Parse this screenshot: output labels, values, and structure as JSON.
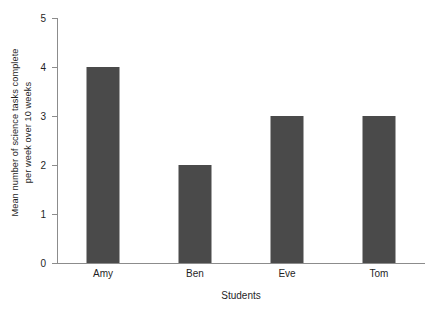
{
  "chart_data": {
    "type": "bar",
    "title": "",
    "subtitle": "",
    "categories": [
      "Amy",
      "Ben",
      "Eve",
      "Tom"
    ],
    "values": [
      4,
      2,
      3,
      3
    ],
    "series": [
      {
        "name": "Mean number of science tasks complete per week over 10 weeks",
        "values": [
          4,
          2,
          3,
          3
        ]
      }
    ],
    "xlabel": "Students",
    "ylabel": "Mean number of science tasks complete per week over 10 weeks",
    "ylabel_lines": [
      "Mean number of science tasks complete",
      "per week over 10 weeks"
    ],
    "ylim": [
      0,
      5
    ],
    "yticks": [
      0,
      1,
      2,
      3,
      4,
      5
    ],
    "ytick_labels": [
      "0",
      "1",
      "2",
      "3",
      "4",
      "5"
    ],
    "xtick_labels": [
      "Amy",
      "Ben",
      "Eve",
      "Tom"
    ],
    "grid": false,
    "legend": false,
    "legend_position": "none",
    "bar_color": "#4a4a4a",
    "axis_color": "#8c8c8c",
    "background_color": "#ffffff",
    "annotations": []
  }
}
